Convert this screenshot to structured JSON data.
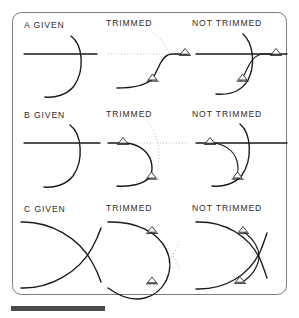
{
  "figure": {
    "frame": {
      "color": "#7d7d7d",
      "x": 12,
      "y": 12,
      "width": 275,
      "height": 283,
      "radius": 9
    },
    "colors": {
      "geometry": "#1a1a1a",
      "trimmed_away_ghost": "#b9b9b9",
      "marker_stroke": "#2b2b2b",
      "frame": "#7d7d7d",
      "rule_bar": "#4a4a4a",
      "caption_text": "#2d2d2d",
      "background": "#ffffff"
    },
    "rule_bar": {
      "x": 11,
      "y": 306,
      "width": 94,
      "height": 5
    }
  },
  "columns": [
    {
      "key": "given",
      "label_suffix": "GIVEN"
    },
    {
      "key": "trimmed",
      "label": "TRIMMED"
    },
    {
      "key": "not_trimmed",
      "label": "NOT TRIMMED"
    }
  ],
  "rows": [
    {
      "id": "A",
      "letter": "A",
      "captions": {
        "given": "A  GIVEN",
        "trimmed": "TRIMMED",
        "not_trimmed": "NOT  TRIMMED"
      },
      "description": "Line meeting a convex arc; fillet forms an S transition below the line.",
      "marker_count": {
        "given": 0,
        "trimmed": 2,
        "not_trimmed": 2
      }
    },
    {
      "id": "B",
      "letter": "B",
      "captions": {
        "given": "B  GIVEN",
        "trimmed": "TRIMMED",
        "not_trimmed": "NOT  TRIMMED"
      },
      "description": "Line meeting a concave arc; fillet sweeps back under the line.",
      "marker_count": {
        "given": 0,
        "trimmed": 2,
        "not_trimmed": 2
      }
    },
    {
      "id": "C",
      "letter": "C",
      "captions": {
        "given": "C  GIVEN",
        "trimmed": "TRIMMED",
        "not_trimmed": "NOT  TRIMMED"
      },
      "description": "Two crossing arcs forming a lens; fillet rounds the crossing point.",
      "marker_count": {
        "given": 0,
        "trimmed": 2,
        "not_trimmed": 2
      }
    }
  ]
}
